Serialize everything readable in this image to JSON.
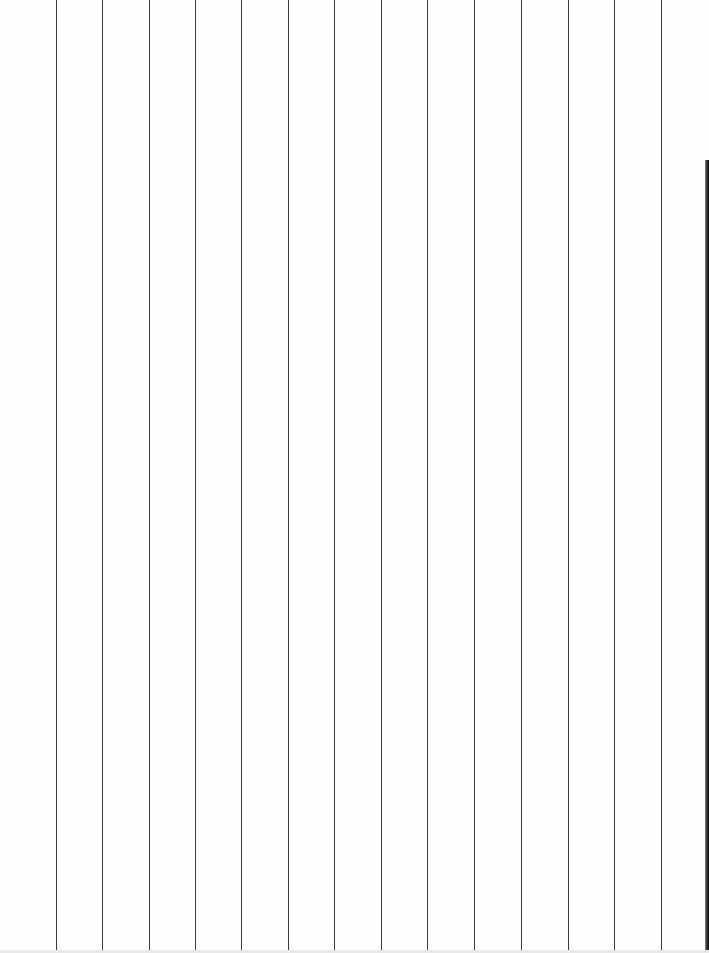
{
  "page": {
    "type": "ruled-paper",
    "orientation": "vertical-lines",
    "background_color": "#fdfdfd",
    "line_color": "#3a3a3a",
    "line_count": 14,
    "line_positions_px": [
      56,
      102,
      149,
      195,
      241,
      288,
      334,
      381,
      427,
      474,
      521,
      568,
      614,
      661
    ],
    "edge_shadow": {
      "side": "right",
      "start_y_px": 160,
      "color": "#111111"
    }
  }
}
